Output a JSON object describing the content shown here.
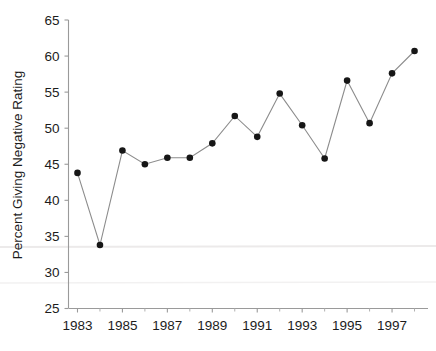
{
  "chart_data": {
    "type": "line",
    "title": "",
    "subtitle": "",
    "xlabel": "",
    "ylabel": "Percent Giving Negative Rating",
    "xlim": [
      1982.6,
      1998.6
    ],
    "ylim": [
      25,
      65
    ],
    "grid": false,
    "legend": "none",
    "marker": "filled-circle",
    "line_style": "solid-thin-gray",
    "x": [
      1983,
      1984,
      1985,
      1986,
      1987,
      1988,
      1989,
      1990,
      1991,
      1992,
      1993,
      1994,
      1995,
      1996,
      1997,
      1998
    ],
    "values": [
      43.8,
      33.8,
      46.9,
      45.0,
      45.9,
      45.9,
      47.9,
      51.7,
      48.8,
      54.8,
      50.4,
      45.8,
      56.6,
      50.7,
      57.6,
      60.7
    ],
    "series": [
      {
        "name": "Percent Giving Negative Rating",
        "values": [
          43.8,
          33.8,
          46.9,
          45.0,
          45.9,
          45.9,
          47.9,
          51.7,
          48.8,
          54.8,
          50.4,
          45.8,
          56.6,
          50.7,
          57.6,
          60.7
        ]
      }
    ],
    "y_ticks": [
      25,
      30,
      35,
      40,
      45,
      50,
      55,
      60,
      65
    ],
    "y_tick_labels": [
      "25",
      "30",
      "35",
      "40",
      "45",
      "50",
      "55",
      "60",
      "65"
    ],
    "x_ticks": [
      1983,
      1984,
      1985,
      1986,
      1987,
      1988,
      1989,
      1990,
      1991,
      1992,
      1993,
      1994,
      1995,
      1996,
      1997,
      1998
    ],
    "x_tick_labels_shown": [
      "1983",
      "1985",
      "1987",
      "1989",
      "1991",
      "1993",
      "1995",
      "1997"
    ],
    "x_tick_labels_shown_values": [
      1983,
      1985,
      1987,
      1989,
      1991,
      1993,
      1995,
      1997
    ],
    "colors": {
      "marker": "#161616",
      "line": "#8c8c8c",
      "axis": "#9a9a9a",
      "text": "#1c1c1c",
      "background": "#ffffff"
    }
  }
}
